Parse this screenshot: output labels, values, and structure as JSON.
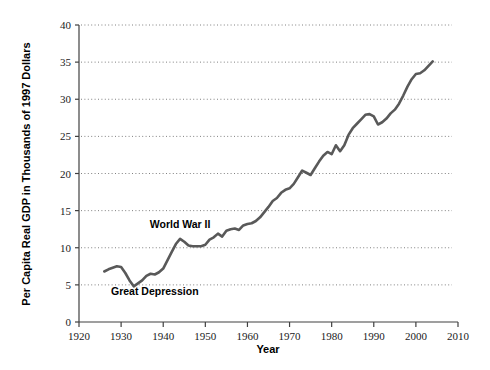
{
  "chart_data": {
    "type": "line",
    "title": "",
    "xlabel": "Year",
    "ylabel": "Per Capita Real GDP in Thousands of 1997 Dollars",
    "xlim": [
      1920,
      2010
    ],
    "ylim": [
      0,
      40
    ],
    "x_ticks": [
      1920,
      1930,
      1940,
      1950,
      1960,
      1970,
      1980,
      1990,
      2000,
      2010
    ],
    "y_ticks": [
      0,
      5,
      10,
      15,
      20,
      25,
      30,
      35,
      40
    ],
    "grid": "horizontal-dotted",
    "legend": "none",
    "line_color": "#595959",
    "series": [
      {
        "name": "Per Capita Real GDP",
        "x": [
          1926,
          1927,
          1928,
          1929,
          1930,
          1931,
          1932,
          1933,
          1934,
          1935,
          1936,
          1937,
          1938,
          1939,
          1940,
          1941,
          1942,
          1943,
          1944,
          1945,
          1946,
          1947,
          1948,
          1949,
          1950,
          1951,
          1952,
          1953,
          1954,
          1955,
          1956,
          1957,
          1958,
          1959,
          1960,
          1961,
          1962,
          1963,
          1964,
          1965,
          1966,
          1967,
          1968,
          1969,
          1970,
          1971,
          1972,
          1973,
          1974,
          1975,
          1976,
          1977,
          1978,
          1979,
          1980,
          1981,
          1982,
          1983,
          1984,
          1985,
          1986,
          1987,
          1988,
          1989,
          1990,
          1991,
          1992,
          1993,
          1994,
          1995,
          1996,
          1997,
          1998,
          1999,
          2000,
          2001,
          2002,
          2003,
          2004
        ],
        "y": [
          6.8,
          7.1,
          7.3,
          7.5,
          7.4,
          6.6,
          5.6,
          4.8,
          5.2,
          5.6,
          6.2,
          6.5,
          6.4,
          6.7,
          7.2,
          8.3,
          9.4,
          10.5,
          11.2,
          10.8,
          10.3,
          10.2,
          10.2,
          10.2,
          10.4,
          11.1,
          11.4,
          11.9,
          11.5,
          12.3,
          12.5,
          12.6,
          12.4,
          13.0,
          13.2,
          13.3,
          13.6,
          14.1,
          14.8,
          15.5,
          16.3,
          16.7,
          17.4,
          17.8,
          18.0,
          18.6,
          19.5,
          20.4,
          20.1,
          19.8,
          20.7,
          21.6,
          22.4,
          22.9,
          22.6,
          23.8,
          23.0,
          23.8,
          25.2,
          26.1,
          26.7,
          27.3,
          27.9,
          28.0,
          27.7,
          26.6,
          26.9,
          27.4,
          28.1,
          28.6,
          29.4,
          30.5,
          31.7,
          32.7,
          33.4,
          33.5,
          33.9,
          34.5,
          35.1
        ]
      }
    ],
    "annotations": [
      {
        "id": "wwii",
        "text": "World War II",
        "x_value": 1944,
        "y_value": 12.6
      },
      {
        "id": "great-depression",
        "text": "Great Depression",
        "x_value": 1938,
        "y_value": 3.6
      }
    ]
  },
  "axis": {
    "x_tick_labels": [
      "1920",
      "1930",
      "1940",
      "1950",
      "1960",
      "1970",
      "1980",
      "1990",
      "2000",
      "2010"
    ],
    "y_tick_labels": [
      "0",
      "5",
      "10",
      "15",
      "20",
      "25",
      "30",
      "35",
      "40"
    ],
    "x_title": "Year",
    "y_title": "Per Capita Real GDP in Thousands of 1997 Dollars"
  },
  "annotations": {
    "wwii_label": "World War II",
    "great_depression_label": "Great Depression"
  },
  "colors": {
    "line": "#595959",
    "axis": "#404040",
    "grid": "#808080",
    "text": "#000000",
    "background": "#ffffff"
  }
}
